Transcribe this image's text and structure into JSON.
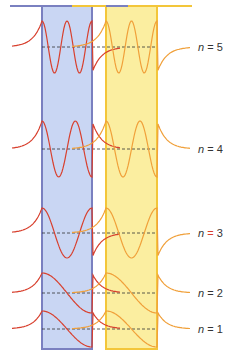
{
  "figure": {
    "title": "",
    "colors": {
      "left_well_fill": "#c9d6f3",
      "left_well_edge": "#7a80c0",
      "right_well_fill": "#fbeea0",
      "right_well_edge": "#f3c63a",
      "left_wave": "#d8402e",
      "right_wave": "#f0a03a",
      "energy_line": "#333333",
      "n_highlight": "#d8402e"
    },
    "levels": [
      {
        "n": 1,
        "label_var": "n",
        "label_eq": " = ",
        "label_num": "1",
        "antinodes": 1
      },
      {
        "n": 2,
        "label_var": "n",
        "label_eq": " = ",
        "label_num": "2",
        "antinodes": 1
      },
      {
        "n": 3,
        "label_var": "n",
        "label_eq": " = ",
        "label_num": "3",
        "antinodes": 3
      },
      {
        "n": 4,
        "label_var": "n",
        "label_eq": " = ",
        "label_num": "4",
        "antinodes": 4
      },
      {
        "n": 5,
        "label_var": "n",
        "label_eq": " = ",
        "label_num": "5",
        "antinodes": 5
      }
    ]
  }
}
